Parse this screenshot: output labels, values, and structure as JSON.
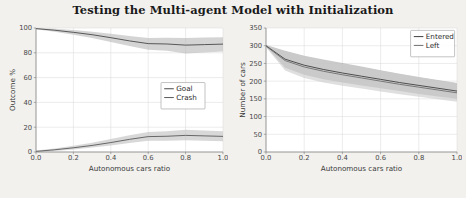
{
  "figure": {
    "title": "Testing the Multi-agent Model with Initialization",
    "background_color": "#f2f1ee",
    "panel_background_color": "#ffffff",
    "grid_color": "#d8d8d8",
    "axis_color": "#7a7a7a"
  },
  "chart_data": [
    {
      "type": "line",
      "panel": "left",
      "title": "",
      "xlabel": "Autonomous cars ratio",
      "ylabel": "Outcome %",
      "xlim": [
        0.0,
        1.0
      ],
      "ylim": [
        0,
        100
      ],
      "xticks": [
        "0.0",
        "0.2",
        "0.4",
        "0.6",
        "0.8",
        "1.0"
      ],
      "xtick_values": [
        0.0,
        0.2,
        0.4,
        0.6,
        0.8,
        1.0
      ],
      "yticks": [
        "0",
        "20",
        "40",
        "60",
        "80",
        "100"
      ],
      "ytick_values": [
        0,
        20,
        40,
        60,
        80,
        100
      ],
      "grid": true,
      "legend_position": "center-right",
      "x": [
        0.0,
        0.1,
        0.2,
        0.3,
        0.4,
        0.5,
        0.6,
        0.7,
        0.8,
        0.9,
        1.0
      ],
      "series": [
        {
          "name": "Goal",
          "color": "#4a4a4a",
          "band_color": "#b9b9b9",
          "values": [
            99.5,
            98.2,
            96.5,
            94.6,
            92.2,
            89.6,
            87.4,
            87.1,
            86.2,
            86.6,
            87.0
          ],
          "band_low": [
            99.0,
            97.0,
            94.6,
            92.0,
            88.8,
            85.4,
            82.4,
            81.6,
            79.4,
            80.2,
            81.0
          ],
          "band_high": [
            100.0,
            99.4,
            98.3,
            97.0,
            95.4,
            93.6,
            92.0,
            92.2,
            92.0,
            92.4,
            92.6
          ]
        },
        {
          "name": "Crash",
          "color": "#5a5a5a",
          "band_color": "#c0c0c0",
          "values": [
            0.5,
            1.8,
            3.4,
            5.3,
            7.6,
            10.2,
            12.4,
            12.7,
            13.4,
            13.0,
            12.6
          ],
          "band_low": [
            0.0,
            0.9,
            2.1,
            3.6,
            5.2,
            7.2,
            9.0,
            9.0,
            9.4,
            9.0,
            8.6
          ],
          "band_high": [
            1.2,
            2.9,
            5.0,
            7.4,
            10.4,
            13.6,
            16.2,
            16.8,
            18.0,
            17.4,
            16.8
          ]
        }
      ]
    },
    {
      "type": "line",
      "panel": "right",
      "title": "",
      "xlabel": "Autonomous cars ratio",
      "ylabel": "Number of cars",
      "xlim": [
        0.0,
        1.0
      ],
      "ylim": [
        0,
        350
      ],
      "xticks": [
        "0.0",
        "0.2",
        "0.4",
        "0.6",
        "0.8",
        "1.0"
      ],
      "xtick_values": [
        0.0,
        0.2,
        0.4,
        0.6,
        0.8,
        1.0
      ],
      "yticks": [
        "0",
        "50",
        "100",
        "150",
        "200",
        "250",
        "300",
        "350"
      ],
      "ytick_values": [
        0,
        50,
        100,
        150,
        200,
        250,
        300,
        350
      ],
      "grid": true,
      "legend_position": "upper-right",
      "x": [
        0.0,
        0.1,
        0.2,
        0.3,
        0.4,
        0.5,
        0.6,
        0.7,
        0.8,
        0.9,
        1.0
      ],
      "series": [
        {
          "name": "Entered",
          "color": "#3f3f3f",
          "band_color": "#a8a8a8",
          "values": [
            300,
            262,
            245,
            233,
            223,
            214,
            205,
            196,
            188,
            180,
            172
          ],
          "band_low": [
            298,
            238,
            218,
            205,
            196,
            188,
            180,
            172,
            164,
            157,
            150
          ],
          "band_high": [
            302,
            286,
            272,
            261,
            251,
            241,
            231,
            221,
            212,
            203,
            195
          ]
        },
        {
          "name": "Left",
          "color": "#6e6e6e",
          "band_color": "#cccccc",
          "values": [
            299,
            258,
            240,
            228,
            218,
            209,
            200,
            191,
            183,
            175,
            167
          ],
          "band_low": [
            296,
            230,
            209,
            196,
            187,
            179,
            171,
            163,
            156,
            149,
            142
          ],
          "band_high": [
            302,
            284,
            270,
            259,
            249,
            239,
            229,
            220,
            211,
            202,
            194
          ]
        }
      ]
    }
  ]
}
